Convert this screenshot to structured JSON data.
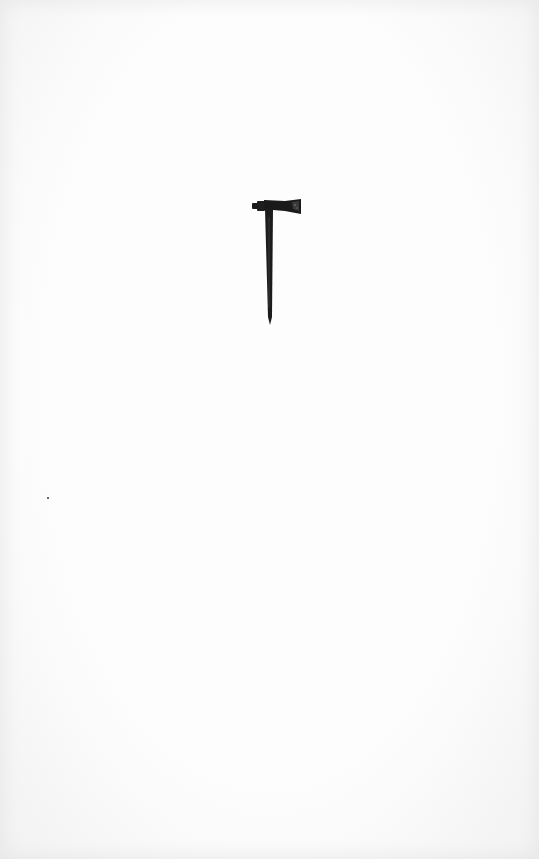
{
  "image": {
    "subject": "pipe tomahawk",
    "background_color": "#fdfdfd",
    "object_color": "#1a1a1a"
  }
}
